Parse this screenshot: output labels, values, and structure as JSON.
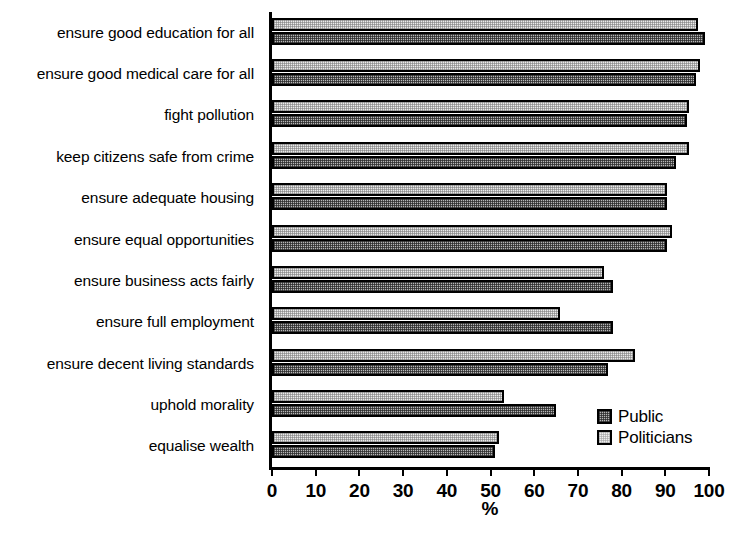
{
  "chart_data": {
    "type": "bar",
    "orientation": "horizontal",
    "title": "",
    "xlabel": "%",
    "ylabel": "",
    "xlim": [
      0,
      100
    ],
    "xticks": [
      0,
      10,
      20,
      30,
      40,
      50,
      60,
      70,
      80,
      90,
      100
    ],
    "grid": false,
    "legend_position": "bottom-right",
    "categories": [
      "ensure good education for all",
      "ensure good medical care for all",
      "fight pollution",
      "keep citizens safe from crime",
      "ensure adequate housing",
      "ensure equal opportunities",
      "ensure business acts fairly",
      "ensure full employment",
      "ensure decent living standards",
      "uphold morality",
      "equalise wealth"
    ],
    "series": [
      {
        "name": "Politicians",
        "fill": "light-dotted",
        "values": [
          97.5,
          98,
          95.5,
          95.5,
          90.5,
          91.5,
          76,
          66,
          83,
          53,
          52
        ]
      },
      {
        "name": "Public",
        "fill": "dark-dotted",
        "values": [
          99,
          97,
          95,
          92.5,
          90.5,
          90.5,
          78,
          78,
          77,
          65,
          51
        ]
      }
    ]
  },
  "legend": {
    "items": [
      {
        "label": "Public",
        "swatch": "dark-dotted"
      },
      {
        "label": "Politicians",
        "swatch": "light-dotted"
      }
    ]
  },
  "axis": {
    "x_title": "%"
  }
}
